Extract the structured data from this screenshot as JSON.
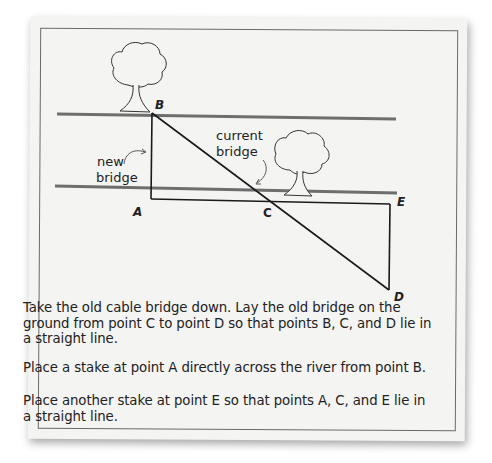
{
  "diagram": {
    "points": {
      "A": {
        "label": "A",
        "x": 151,
        "y": 199
      },
      "B": {
        "label": "B",
        "x": 152,
        "y": 113
      },
      "C": {
        "label": "C",
        "x": 270,
        "y": 201
      },
      "D": {
        "label": "D",
        "x": 389,
        "y": 290
      },
      "E": {
        "label": "E",
        "x": 390,
        "y": 204
      }
    },
    "labels": {
      "new_bridge_line1": "new",
      "new_bridge_line2": "bridge",
      "current_bridge_line1": "current",
      "current_bridge_line2": "bridge"
    },
    "river_banks": [
      "top bank",
      "bottom bank"
    ],
    "trees": [
      "tree near B",
      "tree near E"
    ]
  },
  "instructions": {
    "p1": "Take the old cable bridge down. Lay the old bridge on the ground from point C to point D so that points B, C, and D lie in a straight line.",
    "p2": "Place a stake at point A directly across the river from point B.",
    "p3": "Place another stake at point E so that points A, C, and E lie in a straight line."
  },
  "colors": {
    "card": "#f4f4f3",
    "river_line": "#6e6e6e",
    "line": "#1a1a1a",
    "text": "#222222"
  }
}
